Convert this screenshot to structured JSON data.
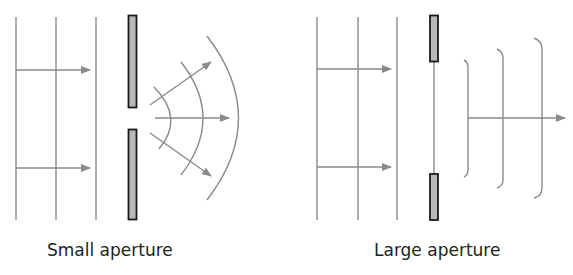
{
  "colors": {
    "line": "#8a8a8a",
    "barrier_fill": "#b8b8b8",
    "barrier_stroke": "#1a1a1a",
    "text": "#222222"
  },
  "panels": [
    {
      "id": "small",
      "caption": "Small aperture",
      "incident_wavefronts_x": [
        16,
        56,
        96
      ],
      "incident_rays_y": [
        70,
        168
      ],
      "barrier": {
        "top": [
          128,
          15,
          9,
          93
        ],
        "bottom": [
          128,
          129,
          9,
          91
        ]
      },
      "diffracted": "circular wavefronts spreading from aperture",
      "outgoing_rays": 3
    },
    {
      "id": "large",
      "caption": "Large aperture",
      "incident_wavefronts_x": [
        317,
        358,
        397
      ],
      "incident_rays_y": [
        69,
        167
      ],
      "barrier": {
        "top": [
          430,
          15,
          8,
          46
        ],
        "bottom": [
          430,
          174,
          8,
          46
        ]
      },
      "diffracted": "nearly plane wavefronts with curved edges",
      "outgoing_rays": 1
    }
  ]
}
